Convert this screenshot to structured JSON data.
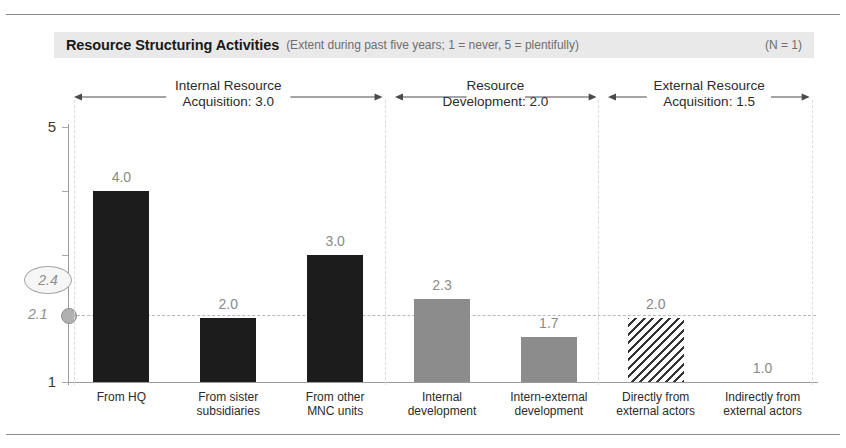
{
  "figure": {
    "title_main": "Resource Structuring Activities",
    "title_sub": "(Extent during past five years; 1 = never, 5 = plentifully)",
    "sample_note": "(N = 1)"
  },
  "axis": {
    "y_top_label": "5",
    "y_bottom_label": "1",
    "reference_value_label": "2.1",
    "reference_oval_label": "2.4"
  },
  "groups": [
    {
      "line1": "Internal Resource",
      "line2": "Acquisition: 3.0"
    },
    {
      "line1": "Resource",
      "line2": "Development: 2.0"
    },
    {
      "line1": "External Resource",
      "line2": "Acquisition: 1.5"
    }
  ],
  "chart_data": {
    "type": "bar",
    "title": "Resource Structuring Activities",
    "subtitle": "(Extent during past five years; 1 = never, 5 = plentifully)",
    "xlabel": "",
    "ylabel": "",
    "ylim": [
      1,
      5
    ],
    "yticks": [
      1,
      5
    ],
    "grid": false,
    "legend": "none",
    "sample_size": 1,
    "reference_line": {
      "value": 2.1,
      "label": "2.1",
      "style": "dashed"
    },
    "annotation_oval": {
      "value": 2.4,
      "label": "2.4"
    },
    "categories": [
      "From HQ",
      "From sister subsidiaries",
      "From other MNC units",
      "Internal development",
      "Intern-external development",
      "Directly from external actors",
      "Indirectly from external actors"
    ],
    "category_lines": [
      [
        "From HQ",
        ""
      ],
      [
        "From sister",
        "subsidiaries"
      ],
      [
        "From other",
        "MNC units"
      ],
      [
        "Internal",
        "development"
      ],
      [
        "Intern-external",
        "development"
      ],
      [
        "Directly from",
        "external actors"
      ],
      [
        "Indirectly from",
        "external actors"
      ]
    ],
    "values": [
      4.0,
      2.0,
      3.0,
      2.3,
      1.7,
      2.0,
      1.0
    ],
    "value_labels": [
      "4.0",
      "2.0",
      "3.0",
      "2.3",
      "1.7",
      "2.0",
      "1.0"
    ],
    "bar_styles": [
      "dark",
      "dark",
      "dark",
      "gray",
      "gray",
      "hatch",
      "hatch"
    ],
    "groups": [
      {
        "name": "Internal Resource Acquisition",
        "mean": 3.0,
        "members": [
          0,
          1,
          2
        ]
      },
      {
        "name": "Resource Development",
        "mean": 2.0,
        "members": [
          3,
          4
        ]
      },
      {
        "name": "External Resource Acquisition",
        "mean": 1.5,
        "members": [
          5,
          6
        ]
      }
    ],
    "colors": {
      "dark": "#1c1c1c",
      "gray": "#8c8c8c",
      "hatch": "#333333",
      "title_band": "#e9e9e9",
      "value_label": "#8a8a8a",
      "reference": "#b8b8b8"
    }
  }
}
